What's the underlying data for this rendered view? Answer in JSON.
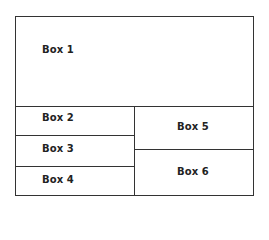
{
  "diagram": {
    "type": "layout-boxes",
    "boxes": [
      {
        "id": 1,
        "label": "Box 1"
      },
      {
        "id": 2,
        "label": "Box 2"
      },
      {
        "id": 3,
        "label": "Box 3"
      },
      {
        "id": 4,
        "label": "Box 4"
      },
      {
        "id": 5,
        "label": "Box 5"
      },
      {
        "id": 6,
        "label": "Box 6"
      }
    ],
    "colors": {
      "line": "#333333",
      "text": "#222222",
      "background": "#ffffff"
    }
  }
}
